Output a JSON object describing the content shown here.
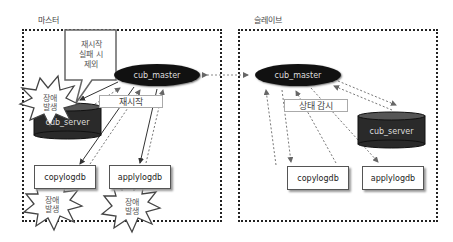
{
  "master": {
    "title": "마스터",
    "cub_master": "cub_master",
    "cub_server": "cub_server",
    "copylogdb": "copylogdb",
    "applylogdb": "applylogdb",
    "restart_label": "재시작",
    "callout_text": [
      "재시작",
      "실패 시",
      "제외"
    ],
    "failure_label_line1": "장애",
    "failure_label_line2": "발생"
  },
  "slave": {
    "title": "슬레이브",
    "cub_master": "cub_master",
    "cub_server": "cub_server",
    "copylogdb": "copylogdb",
    "applylogdb": "applylogdb",
    "monitor_label": "상태 감시"
  },
  "colors": {
    "node_fill": "#111111",
    "cylinder_fill": "#2a2a2a",
    "frame_border": "#222222",
    "arrow_solid": "#222222",
    "arrow_dashed": "#777777"
  }
}
